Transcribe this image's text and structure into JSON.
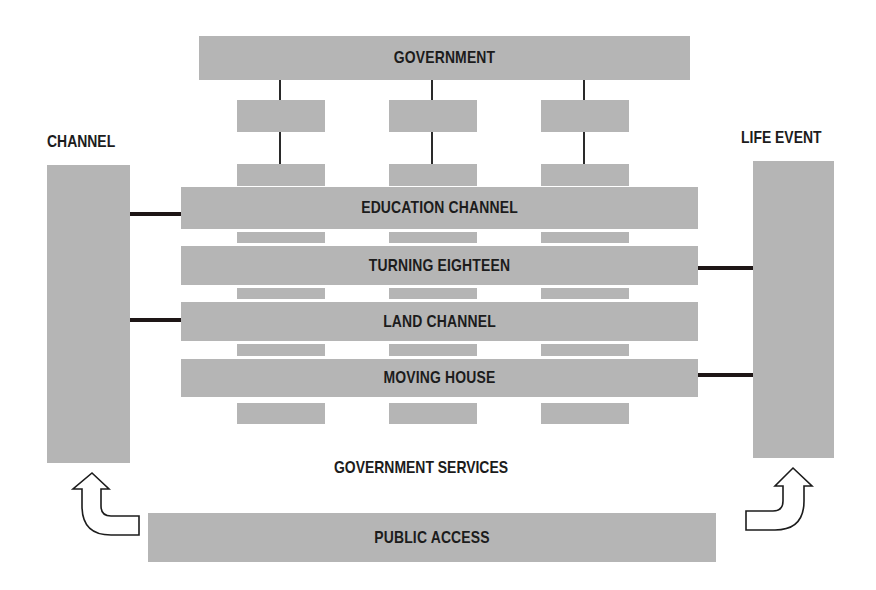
{
  "diagram": {
    "top": {
      "label": "GOVERNMENT"
    },
    "left_column": {
      "heading": "CHANNEL"
    },
    "right_column": {
      "heading": "LIFE EVENT"
    },
    "bars": [
      {
        "label": "EDUCATION CHANNEL",
        "connects": "left"
      },
      {
        "label": "TURNING EIGHTEEN",
        "connects": "right"
      },
      {
        "label": "LAND CHANNEL",
        "connects": "left"
      },
      {
        "label": "MOVING HOUSE",
        "connects": "right"
      }
    ],
    "middle_caption": "GOVERNMENT SERVICES",
    "bottom": {
      "label": "PUBLIC ACCESS"
    },
    "colors": {
      "box_fill": "#b5b5b5",
      "text": "#1c1c1c",
      "connector": "#1e1616",
      "background": "#ffffff"
    }
  }
}
